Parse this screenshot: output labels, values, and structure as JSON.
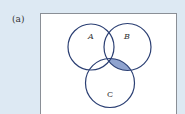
{
  "figure": {
    "label": "(a)",
    "sets": [
      {
        "name": "A",
        "cx": 91,
        "cy": 47,
        "r": 23
      },
      {
        "name": "B",
        "cx": 127.5,
        "cy": 47,
        "r": 23.5
      },
      {
        "name": "C",
        "cx": 110,
        "cy": 83,
        "r": 24.5
      }
    ],
    "shaded_region": "B ∩ C ∩ A'",
    "colors": {
      "background": "#dde9f3",
      "box": "#ffffff",
      "stroke": "#2b3f73",
      "shade": "#8fa3cf"
    }
  }
}
